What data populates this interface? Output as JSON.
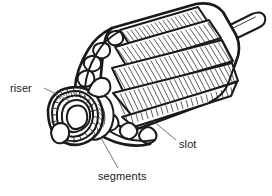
{
  "figure": {
    "background_color": "#ffffff",
    "ink_color": "#1a1a1a",
    "leader_color": "#555555",
    "width": 272,
    "height": 196
  },
  "labels": {
    "riser": "riser",
    "segments": "segments",
    "slot": "slot"
  },
  "parts": {
    "commutator": "commutator",
    "core": "armature-core",
    "windings": "armature-windings",
    "shaft": "shaft",
    "end_loops": "winding-end-loops"
  }
}
